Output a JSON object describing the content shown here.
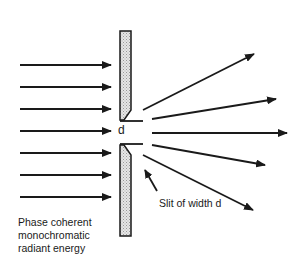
{
  "diagram": {
    "labels": {
      "slit_symbol": "d",
      "slit_caption": "Slit of width d",
      "source_lines": [
        "Phase coherent",
        "monochromatic",
        "radiant energy"
      ]
    },
    "incoming_rays": {
      "count": 7,
      "direction": "left-to-right"
    },
    "diffracted_rays": {
      "count": 5,
      "angles_deg": [
        27,
        9,
        0,
        -11,
        -27
      ]
    },
    "colors": {
      "stroke": "#1a1a1a",
      "barrier_fill": "#d9d9d9",
      "background": "#ffffff"
    }
  }
}
